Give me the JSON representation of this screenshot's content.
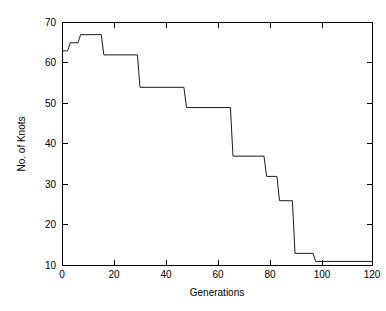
{
  "chart_data": {
    "type": "line",
    "title": "",
    "xlabel": "Generations",
    "ylabel": "No. of Knots",
    "xlim": [
      0,
      120
    ],
    "ylim": [
      10,
      70
    ],
    "xticks": [
      0,
      20,
      40,
      60,
      80,
      100,
      120
    ],
    "yticks": [
      10,
      20,
      30,
      40,
      50,
      60,
      70
    ],
    "xtick_labels": [
      "0",
      "20",
      "40",
      "60",
      "80",
      "100",
      "120"
    ],
    "ytick_labels": [
      "10",
      "20",
      "30",
      "40",
      "50",
      "60",
      "70"
    ],
    "grid": false,
    "legend": false,
    "legend_position": "none",
    "line_color": "#1a1a1a",
    "background_color": "#ffffff",
    "axis_color": "#000000",
    "drawstyle": "steps-post",
    "series": [
      {
        "name": "Best individual",
        "x": [
          0,
          2,
          3,
          6,
          7,
          15,
          16,
          29,
          30,
          47,
          48,
          65,
          66,
          78,
          79,
          83,
          84,
          89,
          90,
          97,
          98,
          120
        ],
        "y": [
          63,
          63,
          65,
          65,
          67,
          67,
          62,
          62,
          54,
          54,
          49,
          49,
          37,
          37,
          32,
          32,
          26,
          26,
          13,
          13,
          11,
          11
        ]
      }
    ],
    "annotations": []
  },
  "figure": {
    "name": "knots-vs-generations-plot"
  }
}
